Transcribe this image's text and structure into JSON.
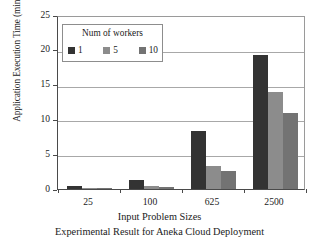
{
  "chart_data": {
    "type": "bar",
    "title": "",
    "subtitle": "Experimental Result for Aneka Cloud Deployment",
    "xlabel": "Input Problem Sizes",
    "ylabel": "Application Execution Time (minutes)",
    "categories": [
      "25",
      "100",
      "625",
      "2500"
    ],
    "series": [
      {
        "name": "1",
        "values": [
          0.4,
          1.3,
          8.4,
          19.2
        ],
        "color": "#333333"
      },
      {
        "name": "5",
        "values": [
          0.15,
          0.5,
          3.3,
          13.9
        ],
        "color": "#8c8c8c"
      },
      {
        "name": "10",
        "values": [
          0.1,
          0.3,
          2.6,
          10.9
        ],
        "color": "#737373"
      }
    ],
    "ylim": [
      0,
      25
    ],
    "yticks": [
      0,
      5,
      10,
      15,
      20,
      25
    ],
    "ytick_labels": [
      "0",
      "5",
      "10",
      "15",
      "20",
      "25"
    ],
    "grid": true,
    "grid_axis": "y",
    "legend_position": "upper-left-inside",
    "legend_title": "Num of workers"
  },
  "legend": {
    "title": "Num of workers",
    "entries": [
      {
        "label": "1",
        "color": "#333333"
      },
      {
        "label": "5",
        "color": "#8c8c8c"
      },
      {
        "label": "10",
        "color": "#737373"
      }
    ]
  },
  "axes": {
    "y_title": "Application Execution Time (minutes)",
    "x_title": "Input Problem Sizes",
    "y_tick_labels": [
      "25",
      "20",
      "15",
      "10",
      "5",
      "0"
    ],
    "x_tick_labels": [
      "25",
      "100",
      "625",
      "2500"
    ]
  },
  "captions": {
    "axis_caption": "Input Problem Sizes",
    "figure_caption": "Experimental Result for Aneka Cloud Deployment"
  }
}
